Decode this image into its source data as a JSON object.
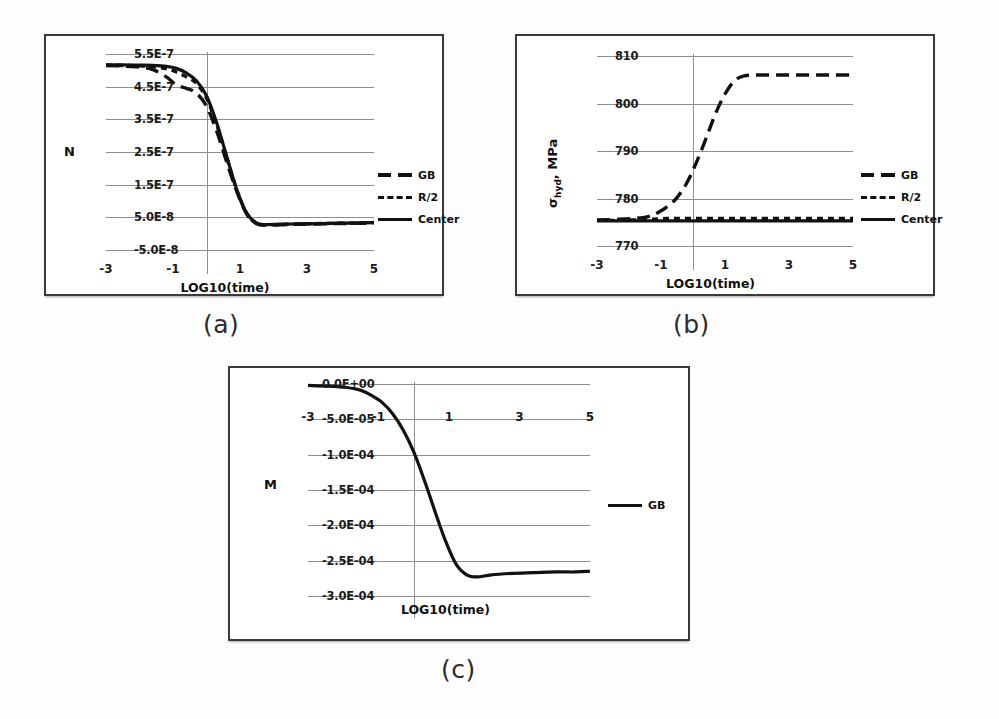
{
  "figure": {
    "captions": {
      "a": "(a)",
      "b": "(b)",
      "c": "(c)"
    }
  },
  "chart_data": [
    {
      "id": "a",
      "type": "line",
      "title": "",
      "xlabel": "LOG10(time)",
      "ylabel": "N",
      "xlim": [
        -3,
        5
      ],
      "ylim": [
        -5e-08,
        5.5e-07
      ],
      "grid": true,
      "legend_position": "right",
      "xticks": [
        -3,
        -1,
        1,
        3,
        5
      ],
      "xtick_labels": [
        "-3",
        "-1",
        "1",
        "3",
        "5"
      ],
      "yticks": [
        5.5e-07,
        4.5e-07,
        3.5e-07,
        2.5e-07,
        1.5e-07,
        5e-08,
        -5e-08
      ],
      "ytick_labels": [
        "5.5E-7",
        "4.5E-7",
        "3.5E-7",
        "2.5E-7",
        "1.5E-7",
        "5.0E-8",
        "-5.0E-8"
      ],
      "x": [
        -3.0,
        -2.5,
        -2.0,
        -1.6,
        -1.2,
        -0.9,
        -0.6,
        -0.3,
        0.0,
        0.3,
        0.6,
        0.9,
        1.2,
        1.5,
        1.8,
        2.2,
        2.8,
        3.4,
        4.0,
        4.6,
        5.0
      ],
      "series": [
        {
          "name": "GB",
          "style": "long-dash",
          "color": "#111111",
          "values": [
            5.15e-07,
            5.13e-07,
            5.1e-07,
            5.02e-07,
            4.8e-07,
            4.55e-07,
            4.45e-07,
            4.3e-07,
            3.9e-07,
            3.15e-07,
            2.2e-07,
            1.3e-07,
            6e-08,
            3e-08,
            2.6e-08,
            2.7e-08,
            2.9e-08,
            3e-08,
            3.1e-08,
            3.2e-08,
            3.3e-08
          ]
        },
        {
          "name": "R/2",
          "style": "short-dash",
          "color": "#111111",
          "values": [
            5.16e-07,
            5.15e-07,
            5.14e-07,
            5.11e-07,
            5.05e-07,
            4.95e-07,
            4.8e-07,
            4.6e-07,
            4.15e-07,
            3.35e-07,
            2.35e-07,
            1.35e-07,
            6.2e-08,
            3.1e-08,
            2.7e-08,
            2.8e-08,
            3e-08,
            3.1e-08,
            3.2e-08,
            3.3e-08,
            3.4e-08
          ]
        },
        {
          "name": "Center",
          "style": "solid",
          "color": "#111111",
          "values": [
            5.17e-07,
            5.17e-07,
            5.16e-07,
            5.15e-07,
            5.12e-07,
            5.06e-07,
            4.92e-07,
            4.68e-07,
            4.22e-07,
            3.4e-07,
            2.38e-07,
            1.36e-07,
            6.3e-08,
            3.2e-08,
            2.8e-08,
            2.9e-08,
            3e-08,
            3.1e-08,
            3.2e-08,
            3.3e-08,
            3.4e-08
          ]
        }
      ]
    },
    {
      "id": "b",
      "type": "line",
      "title": "",
      "xlabel": "LOG10(time)",
      "ylabel": "σhyd, MPa",
      "ylabel_parts": {
        "symbol": "σ",
        "subscript": "hyd",
        "rest": ", MPa"
      },
      "xlim": [
        -3,
        5
      ],
      "ylim": [
        770,
        810
      ],
      "grid": true,
      "legend_position": "right",
      "xticks": [
        -3,
        -1,
        1,
        3,
        5
      ],
      "xtick_labels": [
        "-3",
        "-1",
        "1",
        "3",
        "5"
      ],
      "yticks": [
        810,
        800,
        790,
        780,
        770
      ],
      "ytick_labels": [
        "810",
        "800",
        "790",
        "780",
        "770"
      ],
      "x": [
        -3.0,
        -2.4,
        -1.8,
        -1.4,
        -1.1,
        -0.8,
        -0.5,
        -0.2,
        0.1,
        0.4,
        0.7,
        1.0,
        1.3,
        1.6,
        2.0,
        2.6,
        3.2,
        3.8,
        4.4,
        5.0
      ],
      "series": [
        {
          "name": "GB",
          "style": "long-dash",
          "color": "#111111",
          "values": [
            775.5,
            775.6,
            775.8,
            776.2,
            777.0,
            778.3,
            780.2,
            783.2,
            787.5,
            792.5,
            797.8,
            802.0,
            804.8,
            805.8,
            806.0,
            806.0,
            806.0,
            806.0,
            806.0,
            806.0
          ]
        },
        {
          "name": "R/2",
          "style": "short-dash",
          "color": "#111111",
          "values": [
            775.4,
            775.4,
            775.5,
            775.6,
            775.7,
            775.8,
            775.8,
            775.8,
            775.8,
            775.8,
            775.8,
            775.8,
            775.8,
            775.8,
            775.8,
            775.8,
            775.8,
            775.8,
            775.8,
            775.8
          ]
        },
        {
          "name": "Center",
          "style": "solid",
          "color": "#111111",
          "values": [
            775.3,
            775.3,
            775.3,
            775.3,
            775.3,
            775.3,
            775.3,
            775.3,
            775.3,
            775.3,
            775.3,
            775.3,
            775.3,
            775.3,
            775.3,
            775.3,
            775.3,
            775.3,
            775.3,
            775.3
          ]
        }
      ]
    },
    {
      "id": "c",
      "type": "line",
      "title": "",
      "xlabel": "LOG10(time)",
      "ylabel": "M",
      "xlim": [
        -3,
        5
      ],
      "ylim": [
        -0.0003,
        0.0
      ],
      "grid": true,
      "legend_position": "right",
      "xticks": [
        -3,
        -1,
        1,
        3,
        5
      ],
      "xtick_labels": [
        "-3",
        "-1",
        "1",
        "3",
        "5"
      ],
      "xtick_position": "top",
      "yticks": [
        0.0,
        -5e-05,
        -0.0001,
        -0.00015,
        -0.0002,
        -0.00025,
        -0.0003
      ],
      "ytick_labels": [
        "0.0E+00",
        "-5.0E-05",
        "-1.0E-04",
        "-1.5E-04",
        "-2.0E-04",
        "-2.5E-04",
        "-3.0E-04"
      ],
      "x": [
        -3.0,
        -2.4,
        -1.9,
        -1.5,
        -1.2,
        -0.9,
        -0.6,
        -0.3,
        0.0,
        0.3,
        0.6,
        0.9,
        1.2,
        1.5,
        1.8,
        2.2,
        2.8,
        3.4,
        4.0,
        4.6,
        5.0
      ],
      "series": [
        {
          "name": "GB",
          "style": "solid",
          "color": "#111111",
          "values": [
            -2e-06,
            -3e-06,
            -5e-06,
            -9e-06,
            -1.6e-05,
            -2.6e-05,
            -4.2e-05,
            -6.5e-05,
            -9.6e-05,
            -0.000136,
            -0.00018,
            -0.000222,
            -0.000255,
            -0.00027,
            -0.000273,
            -0.00027,
            -0.000268,
            -0.000267,
            -0.000266,
            -0.000266,
            -0.000265
          ]
        }
      ]
    }
  ]
}
